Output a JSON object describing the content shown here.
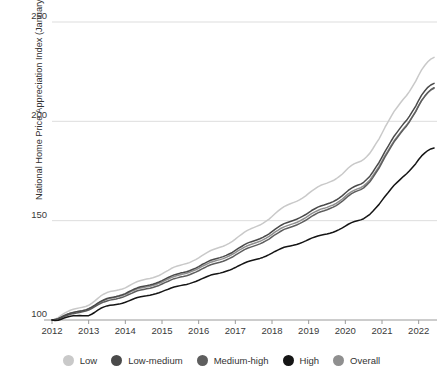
{
  "chart_data": {
    "type": "line",
    "title": "",
    "xlabel": "",
    "ylabel": "National Home Price Appreciation Index (January 2012 = 100)",
    "ylim": [
      95,
      250
    ],
    "xlim": [
      2012.0,
      2022.5
    ],
    "yticks": [
      100,
      150,
      200,
      250
    ],
    "ytick_labels": [
      "100",
      "150",
      "200",
      "250"
    ],
    "xticks": [
      2012,
      2013,
      2014,
      2015,
      2016,
      2017,
      2018,
      2019,
      2020,
      2021,
      2022
    ],
    "xtick_labels": [
      "2012",
      "2013",
      "2014",
      "2015",
      "2016",
      "2017",
      "2018",
      "2019",
      "2020",
      "2021",
      "2022"
    ],
    "grid": "horizontal",
    "legend_position": "bottom",
    "x": [
      2012.0,
      2012.08,
      2012.17,
      2012.25,
      2012.33,
      2012.42,
      2012.5,
      2012.58,
      2012.67,
      2012.75,
      2012.83,
      2012.92,
      2013.0,
      2013.08,
      2013.17,
      2013.25,
      2013.33,
      2013.42,
      2013.5,
      2013.58,
      2013.67,
      2013.75,
      2013.83,
      2013.92,
      2014.0,
      2014.08,
      2014.17,
      2014.25,
      2014.33,
      2014.42,
      2014.5,
      2014.58,
      2014.67,
      2014.75,
      2014.83,
      2014.92,
      2015.0,
      2015.08,
      2015.17,
      2015.25,
      2015.33,
      2015.42,
      2015.5,
      2015.58,
      2015.67,
      2015.75,
      2015.83,
      2015.92,
      2016.0,
      2016.08,
      2016.17,
      2016.25,
      2016.33,
      2016.42,
      2016.5,
      2016.58,
      2016.67,
      2016.75,
      2016.83,
      2016.92,
      2017.0,
      2017.08,
      2017.17,
      2017.25,
      2017.33,
      2017.42,
      2017.5,
      2017.58,
      2017.67,
      2017.75,
      2017.83,
      2017.92,
      2018.0,
      2018.08,
      2018.17,
      2018.25,
      2018.33,
      2018.42,
      2018.5,
      2018.58,
      2018.67,
      2018.75,
      2018.83,
      2018.92,
      2019.0,
      2019.08,
      2019.17,
      2019.25,
      2019.33,
      2019.42,
      2019.5,
      2019.58,
      2019.67,
      2019.75,
      2019.83,
      2019.92,
      2020.0,
      2020.08,
      2020.17,
      2020.25,
      2020.33,
      2020.42,
      2020.5,
      2020.58,
      2020.67,
      2020.75,
      2020.83,
      2020.92,
      2021.0,
      2021.08,
      2021.17,
      2021.25,
      2021.33,
      2021.42,
      2021.5,
      2021.58,
      2021.67,
      2021.75,
      2021.83,
      2021.92,
      2022.0,
      2022.08,
      2022.17,
      2022.25,
      2022.33,
      2022.42
    ],
    "series": [
      {
        "name": "Low",
        "color": "#c9c9c9",
        "values": [
          100,
          100.4,
          101.2,
          102.3,
          103.3,
          104.2,
          104.9,
          105.4,
          105.8,
          106.1,
          106.4,
          106.8,
          107.4,
          108.4,
          109.6,
          110.9,
          112.1,
          113.1,
          113.8,
          114.3,
          114.6,
          114.9,
          115.2,
          115.6,
          116.2,
          117.0,
          117.9,
          118.7,
          119.4,
          119.9,
          120.3,
          120.6,
          120.9,
          121.3,
          121.8,
          122.4,
          123.2,
          124.1,
          125.0,
          125.9,
          126.6,
          127.2,
          127.6,
          128.0,
          128.4,
          128.9,
          129.6,
          130.4,
          131.3,
          132.3,
          133.3,
          134.2,
          135.0,
          135.6,
          136.1,
          136.6,
          137.1,
          137.8,
          138.6,
          139.6,
          140.7,
          141.9,
          143.1,
          144.2,
          145.1,
          145.9,
          146.5,
          147.1,
          147.8,
          148.6,
          149.6,
          150.8,
          152.1,
          153.5,
          154.9,
          156.1,
          157.1,
          157.9,
          158.5,
          159.1,
          159.7,
          160.5,
          161.4,
          162.5,
          163.7,
          164.9,
          166.0,
          167.0,
          167.8,
          168.4,
          168.9,
          169.5,
          170.2,
          171.1,
          172.2,
          173.5,
          175.0,
          176.5,
          177.8,
          178.7,
          179.3,
          179.9,
          180.8,
          182.2,
          184.0,
          186.2,
          188.6,
          191.2,
          194.0,
          196.9,
          199.8,
          202.5,
          205.0,
          207.2,
          209.2,
          211.1,
          213.0,
          215.1,
          217.5,
          220.2,
          223.2,
          225.9,
          228.2,
          230.0,
          231.3,
          232.2
        ]
      },
      {
        "name": "Low-medium",
        "color": "#4a4a4a",
        "values": [
          100,
          100.2,
          100.7,
          101.4,
          102.2,
          102.9,
          103.4,
          103.8,
          104.1,
          104.4,
          104.7,
          105.1,
          105.7,
          106.5,
          107.5,
          108.5,
          109.4,
          110.2,
          110.8,
          111.2,
          111.5,
          111.8,
          112.2,
          112.7,
          113.3,
          114.1,
          114.9,
          115.6,
          116.2,
          116.7,
          117.0,
          117.3,
          117.6,
          118.0,
          118.5,
          119.1,
          119.8,
          120.6,
          121.4,
          122.1,
          122.7,
          123.2,
          123.6,
          123.9,
          124.3,
          124.8,
          125.4,
          126.1,
          126.9,
          127.8,
          128.6,
          129.4,
          130.1,
          130.6,
          131.0,
          131.4,
          131.9,
          132.5,
          133.2,
          134.0,
          135.0,
          136.0,
          137.0,
          137.9,
          138.7,
          139.3,
          139.8,
          140.3,
          140.9,
          141.6,
          142.4,
          143.4,
          144.5,
          145.6,
          146.7,
          147.7,
          148.5,
          149.1,
          149.6,
          150.1,
          150.7,
          151.4,
          152.2,
          153.1,
          154.1,
          155.1,
          156.0,
          156.8,
          157.4,
          157.9,
          158.4,
          158.9,
          159.6,
          160.4,
          161.4,
          162.6,
          163.9,
          165.2,
          166.4,
          167.2,
          167.8,
          168.4,
          169.3,
          170.7,
          172.4,
          174.5,
          176.8,
          179.3,
          182.0,
          184.8,
          187.5,
          190.1,
          192.5,
          194.7,
          196.7,
          198.6,
          200.5,
          202.6,
          205.0,
          207.7,
          210.6,
          213.2,
          215.4,
          217.1,
          218.3,
          219.1
        ]
      },
      {
        "name": "Medium-high",
        "color": "#5e5e5e",
        "values": [
          100,
          100.1,
          100.5,
          101.1,
          101.8,
          102.4,
          102.9,
          103.2,
          103.5,
          103.8,
          104.1,
          104.5,
          105.0,
          105.8,
          106.7,
          107.6,
          108.4,
          109.1,
          109.6,
          110.0,
          110.3,
          110.6,
          111.0,
          111.4,
          112.0,
          112.7,
          113.4,
          114.1,
          114.7,
          115.1,
          115.4,
          115.7,
          116.0,
          116.4,
          116.9,
          117.4,
          118.1,
          118.8,
          119.5,
          120.2,
          120.8,
          121.2,
          121.6,
          121.9,
          122.3,
          122.8,
          123.4,
          124.1,
          124.8,
          125.6,
          126.4,
          127.2,
          127.8,
          128.3,
          128.7,
          129.1,
          129.6,
          130.2,
          130.9,
          131.7,
          132.6,
          133.5,
          134.5,
          135.4,
          136.1,
          136.7,
          137.2,
          137.7,
          138.3,
          139.0,
          139.8,
          140.7,
          141.8,
          142.9,
          143.9,
          144.8,
          145.6,
          146.2,
          146.7,
          147.2,
          147.8,
          148.5,
          149.3,
          150.2,
          151.2,
          152.2,
          153.1,
          153.9,
          154.5,
          155.0,
          155.5,
          156.1,
          156.8,
          157.6,
          158.6,
          159.8,
          161.1,
          162.4,
          163.6,
          164.4,
          165.0,
          165.6,
          166.5,
          167.9,
          169.6,
          171.7,
          174.0,
          176.5,
          179.2,
          182.0,
          184.7,
          187.3,
          189.7,
          191.9,
          193.9,
          195.8,
          197.7,
          199.8,
          202.2,
          204.9,
          207.8,
          210.4,
          212.7,
          214.5,
          215.9,
          216.9
        ]
      },
      {
        "name": "High",
        "color": "#151515",
        "values": [
          100,
          99.7,
          99.9,
          100.4,
          101.0,
          101.5,
          101.9,
          102.1,
          102.2,
          102.3,
          102.2,
          102.1,
          102.2,
          102.9,
          103.9,
          105.0,
          105.9,
          106.6,
          107.1,
          107.4,
          107.6,
          107.8,
          108.0,
          108.4,
          108.9,
          109.5,
          110.2,
          110.8,
          111.3,
          111.7,
          112.0,
          112.2,
          112.5,
          112.8,
          113.2,
          113.7,
          114.3,
          114.9,
          115.5,
          116.1,
          116.6,
          117.0,
          117.3,
          117.6,
          117.9,
          118.3,
          118.8,
          119.4,
          120.0,
          120.7,
          121.4,
          122.0,
          122.6,
          123.0,
          123.3,
          123.6,
          124.0,
          124.5,
          125.0,
          125.7,
          126.4,
          127.2,
          128.0,
          128.7,
          129.3,
          129.8,
          130.2,
          130.6,
          131.0,
          131.5,
          132.1,
          132.9,
          133.7,
          134.5,
          135.3,
          136.0,
          136.6,
          137.0,
          137.3,
          137.6,
          138.0,
          138.5,
          139.1,
          139.8,
          140.5,
          141.2,
          141.8,
          142.3,
          142.7,
          143.0,
          143.3,
          143.7,
          144.2,
          144.8,
          145.5,
          146.4,
          147.3,
          148.2,
          149.0,
          149.6,
          150.0,
          150.4,
          151.0,
          152.0,
          153.2,
          154.7,
          156.4,
          158.2,
          160.2,
          162.2,
          164.2,
          166.1,
          167.8,
          169.4,
          170.8,
          172.2,
          173.6,
          175.1,
          176.8,
          178.7,
          180.8,
          182.6,
          184.1,
          185.3,
          186.1,
          186.6
        ]
      },
      {
        "name": "Overall",
        "color": "#8f8f8f",
        "values": [
          100,
          100.2,
          100.7,
          101.4,
          102.2,
          102.9,
          103.4,
          103.8,
          104.1,
          104.4,
          104.7,
          105.1,
          105.6,
          106.4,
          107.3,
          108.3,
          109.2,
          109.9,
          110.5,
          110.9,
          111.2,
          111.5,
          111.9,
          112.3,
          112.9,
          113.6,
          114.4,
          115.1,
          115.7,
          116.1,
          116.4,
          116.7,
          117.0,
          117.4,
          117.9,
          118.5,
          119.1,
          119.9,
          120.6,
          121.3,
          121.9,
          122.4,
          122.8,
          123.1,
          123.5,
          124.0,
          124.6,
          125.3,
          126.0,
          126.9,
          127.7,
          128.4,
          129.1,
          129.6,
          130.0,
          130.4,
          130.9,
          131.5,
          132.2,
          133.0,
          133.9,
          134.9,
          135.8,
          136.7,
          137.4,
          138.0,
          138.5,
          139.0,
          139.6,
          140.3,
          141.1,
          142.1,
          143.1,
          144.2,
          145.2,
          146.2,
          146.9,
          147.5,
          148.0,
          148.5,
          149.1,
          149.8,
          150.6,
          151.5,
          152.5,
          153.5,
          154.4,
          155.1,
          155.8,
          156.2,
          156.7,
          157.3,
          157.9,
          158.7,
          159.7,
          160.9,
          162.2,
          163.5,
          164.6,
          165.4,
          166.0,
          166.6,
          167.5,
          168.8,
          170.5,
          172.6,
          174.8,
          177.3,
          180.0,
          182.7,
          185.4,
          187.9,
          190.2,
          192.4,
          194.3,
          196.2,
          198.1,
          200.1,
          202.5,
          205.1,
          208.0,
          210.5,
          212.7,
          214.4,
          215.7,
          216.6
        ]
      }
    ]
  }
}
